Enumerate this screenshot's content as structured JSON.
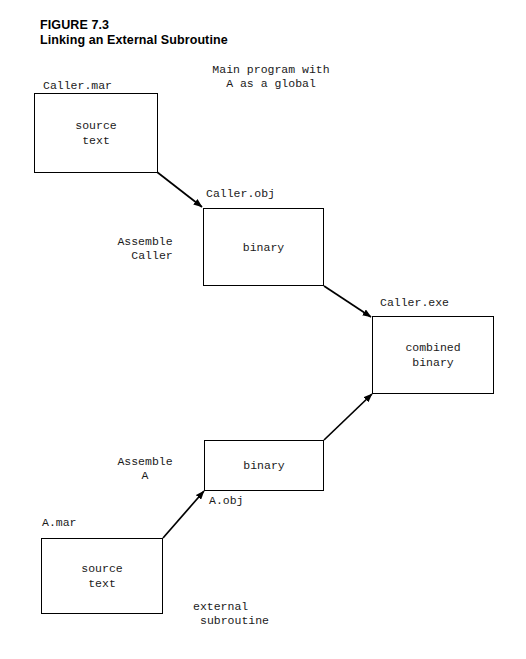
{
  "figure": {
    "number_label": "FIGURE 7.3",
    "caption": "Linking an External Subroutine"
  },
  "annotations": {
    "main_program_note_line1": "Main program with",
    "main_program_note_line2": "A as a global",
    "external_note_line1": "external",
    "external_note_line2": "subroutine"
  },
  "file_labels": {
    "caller_mar": "Caller.mar",
    "caller_obj": "Caller.obj",
    "caller_exe": "Caller.exe",
    "a_mar": "A.mar",
    "a_obj": "A.obj"
  },
  "process_labels": {
    "assemble_caller_line1": "Assemble",
    "assemble_caller_line2": "Caller",
    "assemble_a_line1": "Assemble",
    "assemble_a_line2": "A"
  },
  "boxes": {
    "caller_source": "source\ntext",
    "caller_binary": "binary",
    "combined_binary": "combined\nbinary",
    "a_binary": "binary",
    "a_source": "source\ntext"
  },
  "colors": {
    "page_background": "#ffffff",
    "ink": "#000000",
    "text": "#1a1a1a"
  }
}
